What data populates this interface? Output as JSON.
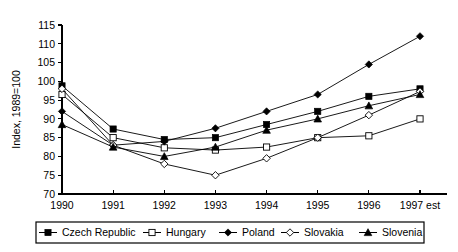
{
  "chart_data": {
    "type": "line",
    "title": "",
    "xlabel": "",
    "ylabel": "Index, 1989=100",
    "categories": [
      "1990",
      "1991",
      "1992",
      "1993",
      "1994",
      "1995",
      "1996",
      "1997 est"
    ],
    "x_tick_labels": [
      "1990",
      "1991",
      "1992",
      "1993",
      "1994",
      "1995",
      "1996",
      "1997 est"
    ],
    "y_tick_labels": [
      "70",
      "75",
      "80",
      "85",
      "90",
      "95",
      "100",
      "105",
      "110",
      "115"
    ],
    "ylim": [
      70,
      115
    ],
    "y_tick_step": 5,
    "grid": false,
    "legend_position": "bottom",
    "series": [
      {
        "name": "Czech Republic",
        "marker": "filled-square",
        "values": [
          98.8,
          87.3,
          84.5,
          85.0,
          88.5,
          92.0,
          96.0,
          98.0
        ]
      },
      {
        "name": "Hungary",
        "marker": "open-square",
        "values": [
          96.5,
          85.0,
          82.3,
          81.7,
          82.5,
          85.0,
          85.5,
          90.0
        ]
      },
      {
        "name": "Poland",
        "marker": "filled-diamond",
        "values": [
          92.0,
          83.0,
          84.0,
          87.5,
          92.0,
          96.5,
          104.5,
          112.0
        ]
      },
      {
        "name": "Slovakia",
        "marker": "open-diamond",
        "values": [
          98.0,
          83.0,
          78.0,
          75.0,
          79.5,
          85.0,
          91.0,
          97.3
        ]
      },
      {
        "name": "Slovenia",
        "marker": "filled-triangle",
        "values": [
          88.5,
          82.5,
          80.0,
          82.5,
          87.0,
          90.0,
          93.5,
          96.5
        ]
      }
    ]
  },
  "legend": {
    "entries": [
      {
        "label": "Czech Republic",
        "marker": "filled-square"
      },
      {
        "label": "Hungary",
        "marker": "open-square"
      },
      {
        "label": "Poland",
        "marker": "filled-diamond"
      },
      {
        "label": "Slovakia",
        "marker": "open-diamond"
      },
      {
        "label": "Slovenia",
        "marker": "filled-triangle"
      }
    ]
  },
  "colors": {
    "ink": "#000000",
    "background": "#ffffff"
  }
}
